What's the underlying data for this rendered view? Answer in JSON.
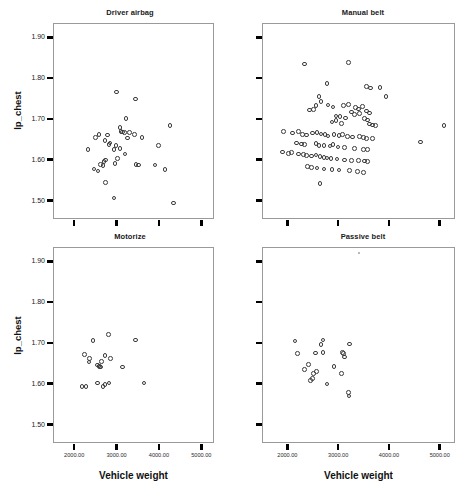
{
  "figure": {
    "type": "scatterplot-matrix",
    "axis_titles": {
      "x": "Vehicle weight",
      "y": "lp_chest"
    },
    "x_ticks": [
      "2000.00",
      "3000.00",
      "4000.00",
      "5000.00"
    ],
    "x_tick_values": [
      2000,
      3000,
      4000,
      5000
    ],
    "y_ticks": [
      "1.90",
      "1.80",
      "1.70",
      "1.60",
      "1.50"
    ],
    "y_tick_values": [
      1.9,
      1.8,
      1.7,
      1.6,
      1.5
    ],
    "xlim": [
      1500,
      5300
    ],
    "ylim": [
      1.455,
      1.935
    ],
    "grid": false,
    "legend": false,
    "marker": "open-circle"
  },
  "chart_data": [
    {
      "type": "scatter",
      "title": "Driver airbag",
      "xlabel": "Vehicle weight",
      "ylabel": "lp_chest",
      "xlim": [
        1500,
        5300
      ],
      "ylim": [
        1.455,
        1.935
      ],
      "grid": false,
      "legend_position": "none",
      "x": [
        2300,
        2480,
        2560,
        2980,
        3420,
        3200,
        3060,
        2760,
        2700,
        3280,
        3400,
        3580,
        3960,
        4240,
        3080,
        3120,
        3160,
        2960,
        2920,
        3060,
        3180,
        3240,
        2820,
        2800,
        2720,
        2680,
        3000,
        3440,
        3500,
        3880,
        4120,
        2600,
        2660,
        2940,
        2540,
        2440,
        2720,
        2920,
        4320
      ],
      "y": [
        1.627,
        1.657,
        1.665,
        1.768,
        1.751,
        1.703,
        1.681,
        1.663,
        1.649,
        1.67,
        1.665,
        1.657,
        1.637,
        1.686,
        1.672,
        1.671,
        1.669,
        1.637,
        1.628,
        1.63,
        1.617,
        1.656,
        1.644,
        1.64,
        1.602,
        1.598,
        1.605,
        1.591,
        1.59,
        1.59,
        1.578,
        1.591,
        1.589,
        1.593,
        1.575,
        1.58,
        1.547,
        1.509,
        1.497
      ],
      "n_points": 39
    },
    {
      "type": "scatter",
      "title": "Manual belt",
      "xlabel": "Vehicle weight",
      "ylabel": "lp_chest",
      "xlim": [
        1500,
        5300
      ],
      "ylim": [
        1.455,
        1.935
      ],
      "grid": false,
      "legend_position": "none",
      "x": [
        2320,
        3180,
        2760,
        3540,
        3620,
        3800,
        2600,
        3920,
        2640,
        2540,
        2780,
        2880,
        3080,
        3180,
        3320,
        3380,
        3460,
        3540,
        2500,
        2420,
        3240,
        3300,
        3400,
        3600,
        2940,
        3020,
        3120,
        3500,
        3560,
        2860,
        2940,
        3040,
        3600,
        3660,
        3720,
        5060,
        1900,
        2080,
        2200,
        2280,
        2360,
        2480,
        2560,
        2640,
        2720,
        2780,
        2900,
        3000,
        3060,
        3160,
        3260,
        3400,
        3480,
        3540,
        3660,
        4600,
        2160,
        2260,
        2320,
        2540,
        2600,
        2700,
        2820,
        2880,
        2980,
        3100,
        3300,
        3480,
        3560,
        1880,
        2000,
        2060,
        2200,
        2300,
        2360,
        2460,
        2540,
        2620,
        2700,
        2760,
        2840,
        2960,
        3100,
        3240,
        3380,
        3500,
        3560,
        2380,
        2460,
        2560,
        2700,
        2860,
        3000,
        3200,
        3360,
        3480,
        2620
      ],
      "y": [
        1.837,
        1.84,
        1.789,
        1.782,
        1.778,
        1.78,
        1.758,
        1.757,
        1.745,
        1.735,
        1.737,
        1.732,
        1.735,
        1.738,
        1.73,
        1.727,
        1.733,
        1.722,
        1.726,
        1.724,
        1.719,
        1.714,
        1.716,
        1.717,
        1.71,
        1.708,
        1.705,
        1.703,
        1.7,
        1.695,
        1.698,
        1.692,
        1.69,
        1.688,
        1.687,
        1.687,
        1.672,
        1.668,
        1.672,
        1.665,
        1.663,
        1.668,
        1.67,
        1.666,
        1.664,
        1.661,
        1.665,
        1.662,
        1.664,
        1.659,
        1.658,
        1.66,
        1.657,
        1.655,
        1.654,
        1.646,
        1.644,
        1.641,
        1.64,
        1.643,
        1.638,
        1.637,
        1.636,
        1.64,
        1.634,
        1.632,
        1.63,
        1.628,
        1.627,
        1.622,
        1.618,
        1.62,
        1.617,
        1.615,
        1.613,
        1.612,
        1.614,
        1.61,
        1.608,
        1.607,
        1.605,
        1.604,
        1.602,
        1.601,
        1.6,
        1.599,
        1.598,
        1.586,
        1.584,
        1.582,
        1.58,
        1.578,
        1.577,
        1.576,
        1.574,
        1.572,
        1.545
      ],
      "n_points": 97
    },
    {
      "type": "scatter",
      "title": "Motorize",
      "xlabel": "Vehicle weight",
      "ylabel": "lp_chest",
      "xlim": [
        1500,
        5300
      ],
      "ylim": [
        1.455,
        1.935
      ],
      "grid": false,
      "legend_position": "none",
      "x": [
        2780,
        2420,
        3420,
        2220,
        2340,
        2330,
        2700,
        2520,
        2560,
        2580,
        2600,
        2620,
        2840,
        3120,
        2160,
        2260,
        2520,
        2660,
        2700,
        2800,
        3620
      ],
      "y": [
        1.723,
        1.709,
        1.71,
        1.674,
        1.664,
        1.656,
        1.672,
        1.648,
        1.646,
        1.645,
        1.644,
        1.657,
        1.664,
        1.644,
        1.596,
        1.596,
        1.604,
        1.596,
        1.6,
        1.604,
        1.604
      ],
      "n_points": 21
    },
    {
      "type": "scatter",
      "title": "Passive belt",
      "xlabel": "Vehicle weight",
      "ylabel": "lp_chest",
      "xlim": [
        1500,
        5300
      ],
      "ylim": [
        1.455,
        1.935
      ],
      "grid": false,
      "legend_position": "none",
      "x": [
        2130,
        2640,
        2680,
        3200,
        2530,
        2680,
        3070,
        3090,
        3100,
        2180,
        2400,
        2900,
        2320,
        2550,
        2500,
        3040,
        2440,
        2470,
        2760,
        3180,
        3190
      ],
      "y": [
        1.707,
        1.699,
        1.71,
        1.7,
        1.678,
        1.679,
        1.679,
        1.677,
        1.668,
        1.677,
        1.65,
        1.645,
        1.637,
        1.633,
        1.628,
        1.628,
        1.61,
        1.616,
        1.602,
        1.581,
        1.573
      ],
      "n_points": 21
    }
  ]
}
